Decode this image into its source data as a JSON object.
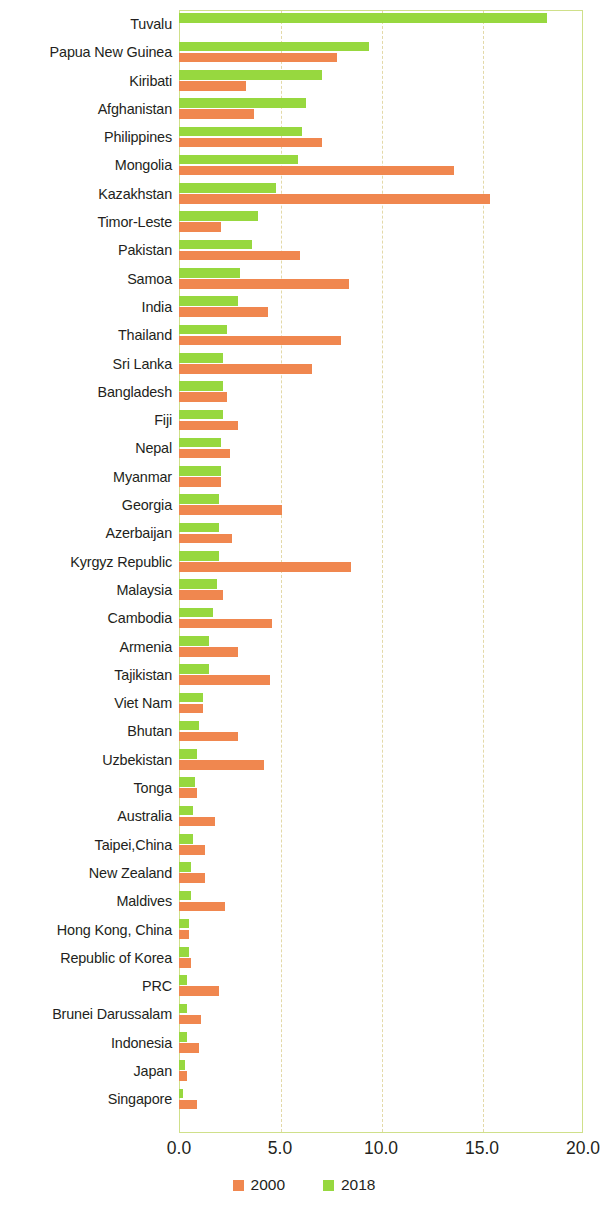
{
  "chart_data": {
    "type": "bar",
    "orientation": "horizontal",
    "title": "",
    "subtitle": "",
    "xlabel": "",
    "ylabel": "",
    "xlim": [
      0.0,
      20.0
    ],
    "xticks": [
      "0.0",
      "5.0",
      "10.0",
      "15.0",
      "20.0"
    ],
    "xtick_values": [
      0.0,
      5.0,
      10.0,
      15.0,
      20.0
    ],
    "grid": "vertical-dashed",
    "legend_position": "bottom-center",
    "categories": [
      "Tuvalu",
      "Papua New Guinea",
      "Kiribati",
      "Afghanistan",
      "Philippines",
      "Mongolia",
      "Kazakhstan",
      "Timor-Leste",
      "Pakistan",
      "Samoa",
      "India",
      "Thailand",
      "Sri Lanka",
      "Bangladesh",
      "Fiji",
      "Nepal",
      "Myanmar",
      "Georgia",
      "Azerbaijan",
      "Kyrgyz Republic",
      "Malaysia",
      "Cambodia",
      "Armenia",
      "Tajikistan",
      "Viet Nam",
      "Bhutan",
      "Uzbekistan",
      "Tonga",
      "Australia",
      "Taipei,China",
      "New Zealand",
      "Maldives",
      "Hong Kong, China",
      "Republic of Korea",
      "PRC",
      "Brunei Darussalam",
      "Indonesia",
      "Japan",
      "Singapore"
    ],
    "series": [
      {
        "name": "2000",
        "color": "#F0874F",
        "values": [
          0.0,
          7.8,
          3.3,
          3.7,
          7.1,
          13.6,
          15.4,
          2.1,
          6.0,
          8.4,
          4.4,
          8.0,
          6.6,
          2.4,
          2.9,
          2.5,
          2.1,
          5.1,
          2.6,
          8.5,
          2.2,
          4.6,
          2.9,
          4.5,
          1.2,
          2.9,
          4.2,
          0.9,
          1.8,
          1.3,
          1.3,
          2.3,
          0.5,
          0.6,
          2.0,
          1.1,
          1.0,
          0.4,
          0.9
        ]
      },
      {
        "name": "2018",
        "color": "#97D83F",
        "values": [
          18.2,
          9.4,
          7.1,
          6.3,
          6.1,
          5.9,
          4.8,
          3.9,
          3.6,
          3.0,
          2.9,
          2.4,
          2.2,
          2.2,
          2.2,
          2.1,
          2.1,
          2.0,
          2.0,
          2.0,
          1.9,
          1.7,
          1.5,
          1.5,
          1.2,
          1.0,
          0.9,
          0.8,
          0.7,
          0.7,
          0.6,
          0.6,
          0.5,
          0.5,
          0.4,
          0.4,
          0.4,
          0.3,
          0.2
        ]
      }
    ]
  },
  "legend": {
    "items": [
      {
        "label": "2000",
        "color": "#F0874F"
      },
      {
        "label": "2018",
        "color": "#97D83F"
      }
    ]
  },
  "colors": {
    "series_2000": "#F0874F",
    "series_2018": "#97D83F",
    "plot_border": "#cfe08a",
    "gridline": "#e3d9a8",
    "text": "#231f20",
    "background": "#ffffff"
  }
}
